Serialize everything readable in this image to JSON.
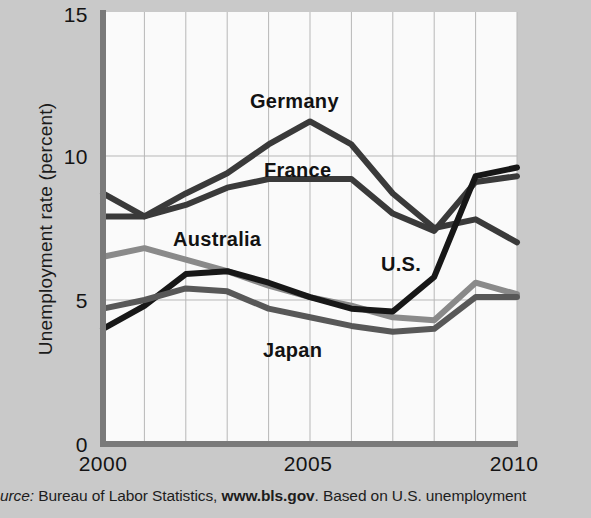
{
  "chart_data": {
    "type": "line",
    "title": "",
    "xlabel": "",
    "ylabel": "Unemployment rate (percent)",
    "xlim": [
      2000,
      2010
    ],
    "ylim": [
      0,
      15
    ],
    "yticks": [
      0,
      5,
      10,
      15
    ],
    "ytick_labels": [
      "0",
      "5",
      "10",
      "15"
    ],
    "xticks": [
      2000,
      2005,
      2010
    ],
    "xtick_labels": [
      "2000",
      "2005",
      "2010"
    ],
    "gridlines": "vertical at every year; horizontal at 5 and 10",
    "legend_position": "inline labels on plot",
    "x": [
      2000,
      2001,
      2002,
      2003,
      2004,
      2005,
      2006,
      2007,
      2008,
      2009,
      2010
    ],
    "series": [
      {
        "name": "Germany",
        "color": "#3a3a3a",
        "values": [
          8.7,
          7.9,
          8.7,
          9.4,
          10.4,
          11.2,
          10.4,
          8.7,
          7.5,
          7.8,
          7.0
        ]
      },
      {
        "name": "France",
        "color": "#3a3a3a",
        "values": [
          7.9,
          7.9,
          8.3,
          8.9,
          9.2,
          9.2,
          9.2,
          8.0,
          7.4,
          9.1,
          9.3
        ]
      },
      {
        "name": "Australia",
        "color": "#8a8a8a",
        "values": [
          6.5,
          6.8,
          6.4,
          6.0,
          5.5,
          5.1,
          4.8,
          4.4,
          4.3,
          5.6,
          5.2
        ]
      },
      {
        "name": "U.S.",
        "color": "#171717",
        "values": [
          4.0,
          4.8,
          5.9,
          6.0,
          5.6,
          5.1,
          4.7,
          4.6,
          5.8,
          9.3,
          9.6
        ]
      },
      {
        "name": "Japan",
        "color": "#585858",
        "values": [
          4.7,
          5.0,
          5.4,
          5.3,
          4.7,
          4.4,
          4.1,
          3.9,
          4.0,
          5.1,
          5.1
        ]
      }
    ],
    "series_labels": [
      {
        "text": "Germany",
        "x": 250,
        "y": 90
      },
      {
        "text": "France",
        "x": 264,
        "y": 159
      },
      {
        "text": "Australia",
        "x": 173,
        "y": 228
      },
      {
        "text": "U.S.",
        "x": 381,
        "y": 253
      },
      {
        "text": "Japan",
        "x": 263,
        "y": 339
      }
    ],
    "caption": {
      "source_word": "urce:",
      "body": " Bureau of Labor Statistics, ",
      "link": "www.bls.gov",
      "tail": ". Based on U.S. unemployment"
    }
  },
  "colors": {
    "page_background": "#c9c9c9",
    "plot_background": "#fafafa",
    "axis": "#7a7a7a",
    "grid": "#b7b7b7",
    "text": "#141414"
  }
}
